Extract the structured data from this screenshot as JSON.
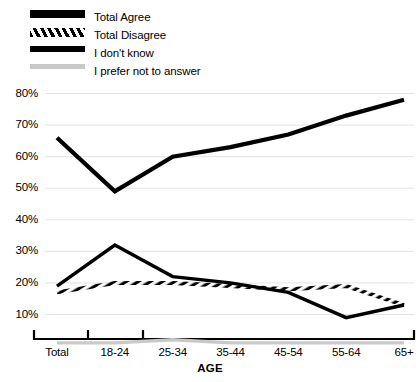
{
  "legend": {
    "items": [
      {
        "label": "Total Agree",
        "style": "thick-solid-black",
        "color": "#000000"
      },
      {
        "label": "Total Disagree",
        "style": "hatched-diagonal",
        "color": "#000000"
      },
      {
        "label": "I don't know",
        "style": "medium-solid-black",
        "color": "#000000"
      },
      {
        "label": "I prefer not to answer",
        "style": "light-gray-solid",
        "color": "#c9c9c9"
      }
    ]
  },
  "axes": {
    "x_title": "AGE",
    "y_ticks": [
      "10%",
      "20%",
      "30%",
      "40%",
      "50%",
      "60%",
      "70%",
      "80%"
    ],
    "x_ticks": [
      "Total",
      "18-24",
      "25-34",
      "35-44",
      "45-54",
      "55-64",
      "65+"
    ]
  },
  "chart_data": {
    "type": "line",
    "title": "",
    "xlabel": "AGE",
    "ylabel": "",
    "ylim": [
      0,
      85
    ],
    "ytick_values": [
      10,
      20,
      30,
      40,
      50,
      60,
      70,
      80
    ],
    "grid": true,
    "legend_position": "top-left",
    "categories": [
      "Total",
      "18-24",
      "25-34",
      "35-44",
      "45-54",
      "55-64",
      "65+"
    ],
    "series": [
      {
        "name": "Total Agree",
        "color": "#000000",
        "line_width": 4.2,
        "dash": "solid",
        "values": [
          66,
          49,
          60,
          63,
          67,
          73,
          78
        ]
      },
      {
        "name": "Total Disagree",
        "color": "#000000",
        "line_width": 4.0,
        "dash": "hatched",
        "values": [
          17,
          20,
          20,
          19,
          18,
          19,
          13
        ]
      },
      {
        "name": "I don't know",
        "color": "#000000",
        "line_width": 3.4,
        "dash": "solid",
        "values": [
          19,
          32,
          22,
          20,
          17,
          9,
          13
        ]
      },
      {
        "name": "I prefer not to answer",
        "color": "#c9c9c9",
        "line_width": 3.4,
        "dash": "solid",
        "values": [
          1,
          1,
          2,
          1,
          1,
          1,
          1
        ]
      }
    ]
  }
}
